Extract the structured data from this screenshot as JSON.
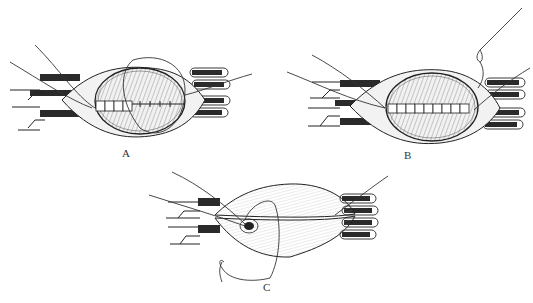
{
  "figure": {
    "type": "surgical illustration",
    "panels": [
      {
        "id": "A",
        "label": "A",
        "description": "Opened tissue with partial interrupted suture row and looping thread"
      },
      {
        "id": "B",
        "label": "B",
        "description": "Opened tissue with complete suture row and needle with thread"
      },
      {
        "id": "C",
        "label": "C",
        "description": "Closed tissue with knot tied at one end and loose thread"
      }
    ]
  },
  "colors": {
    "ink": "#222222",
    "background": "#ffffff",
    "wound_fill": "#8a8a8a"
  }
}
